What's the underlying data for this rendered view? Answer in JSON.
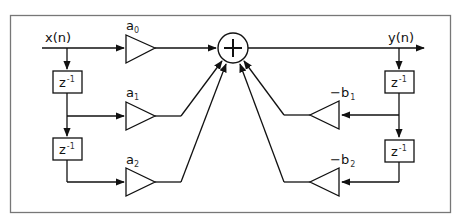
{
  "diagram": {
    "type": "biquad-filter-direct-form-I",
    "input_label": "x(n)",
    "output_label": "y(n)",
    "adder_symbol": "+",
    "delay_label": "z",
    "delay_exponent": "-1",
    "feedforward_gains": [
      {
        "base": "a",
        "sub": "0"
      },
      {
        "base": "a",
        "sub": "1"
      },
      {
        "base": "a",
        "sub": "2"
      }
    ],
    "feedback_gains": [
      {
        "base": "−b",
        "sub": "1"
      },
      {
        "base": "−b",
        "sub": "2"
      }
    ],
    "colors": {
      "stroke": "#111111",
      "frame": "#666666",
      "background": "#ffffff"
    }
  }
}
